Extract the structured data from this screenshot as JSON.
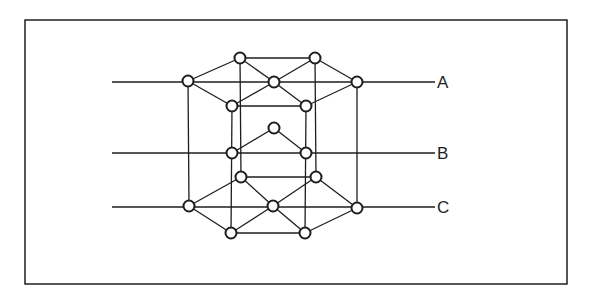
{
  "diagram": {
    "frame": {
      "x": 25,
      "y": 20,
      "w": 542,
      "h": 264
    },
    "layers": [
      {
        "name": "A",
        "y": 82,
        "label": "A"
      },
      {
        "name": "B",
        "y": 153,
        "label": "B"
      },
      {
        "name": "C",
        "y": 207,
        "label": "C"
      }
    ],
    "layer_lines": {
      "x_start": 112,
      "x_end": 435
    },
    "label_x": 437,
    "atoms": [
      {
        "id": "a_top_l",
        "x": 240,
        "y": 58
      },
      {
        "id": "a_top_r",
        "x": 315,
        "y": 58
      },
      {
        "id": "a_l",
        "x": 188,
        "y": 81
      },
      {
        "id": "a_c",
        "x": 274,
        "y": 82
      },
      {
        "id": "a_r",
        "x": 357,
        "y": 82
      },
      {
        "id": "a_bot_l",
        "x": 232,
        "y": 106
      },
      {
        "id": "a_bot_r",
        "x": 306,
        "y": 106
      },
      {
        "id": "b_top",
        "x": 274,
        "y": 128
      },
      {
        "id": "b_l",
        "x": 232,
        "y": 153
      },
      {
        "id": "b_r",
        "x": 306,
        "y": 153
      },
      {
        "id": "c_top_l",
        "x": 241,
        "y": 177
      },
      {
        "id": "c_top_r",
        "x": 316,
        "y": 177
      },
      {
        "id": "c_l",
        "x": 189,
        "y": 206
      },
      {
        "id": "c_c",
        "x": 273,
        "y": 206
      },
      {
        "id": "c_r",
        "x": 357,
        "y": 208
      },
      {
        "id": "c_bot_l",
        "x": 231,
        "y": 233
      },
      {
        "id": "c_bot_r",
        "x": 305,
        "y": 233
      }
    ],
    "bonds": [
      [
        "a_l",
        "a_top_l"
      ],
      [
        "a_top_l",
        "a_c"
      ],
      [
        "a_c",
        "a_top_r"
      ],
      [
        "a_top_r",
        "a_r"
      ],
      [
        "a_l",
        "a_bot_l"
      ],
      [
        "a_bot_l",
        "a_c"
      ],
      [
        "a_c",
        "a_bot_r"
      ],
      [
        "a_bot_r",
        "a_r"
      ],
      [
        "a_top_l",
        "a_top_r"
      ],
      [
        "a_bot_l",
        "a_bot_r"
      ],
      [
        "b_l",
        "b_top"
      ],
      [
        "b_top",
        "b_r"
      ],
      [
        "c_l",
        "c_top_l"
      ],
      [
        "c_top_l",
        "c_c"
      ],
      [
        "c_c",
        "c_top_r"
      ],
      [
        "c_top_r",
        "c_r"
      ],
      [
        "c_l",
        "c_bot_l"
      ],
      [
        "c_bot_l",
        "c_c"
      ],
      [
        "c_c",
        "c_bot_r"
      ],
      [
        "c_bot_r",
        "c_r"
      ],
      [
        "c_top_l",
        "c_top_r"
      ],
      [
        "c_bot_l",
        "c_bot_r"
      ],
      [
        "a_l",
        "c_l"
      ],
      [
        "a_r",
        "c_r"
      ],
      [
        "a_top_l",
        "c_top_l"
      ],
      [
        "a_top_r",
        "c_top_r"
      ],
      [
        "a_bot_l",
        "c_bot_l"
      ],
      [
        "a_bot_r",
        "c_bot_r"
      ]
    ],
    "atom_radius": 5.5,
    "stroke_color": "#1e1e1e"
  }
}
